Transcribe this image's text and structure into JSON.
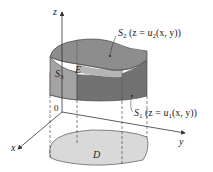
{
  "figure": {
    "axes": {
      "x_label": "x",
      "y_label": "y",
      "z_label": "z",
      "origin_label": "0"
    },
    "region": {
      "solid_label": "E",
      "domain_label": "D"
    },
    "surfaces": {
      "top": {
        "name": "S",
        "sub": "2",
        "eq_pre": "(z = ",
        "fn": "u",
        "fn_sub": "2",
        "eq_post": "(x, y))"
      },
      "bottom": {
        "name": "S",
        "sub": "1",
        "eq_pre": "(z = ",
        "fn": "u",
        "fn_sub": "1",
        "eq_post": "(x, y))"
      },
      "side": {
        "name": "S",
        "sub": "3"
      }
    },
    "colors": {
      "top_surface": "#8d8d8d",
      "side_front": "#a9a9a9",
      "side_dark": "#7a7a7a",
      "bottom_face": "#6f6f6f",
      "domain_fill": "#d9d9d9",
      "line": "#333333"
    }
  }
}
